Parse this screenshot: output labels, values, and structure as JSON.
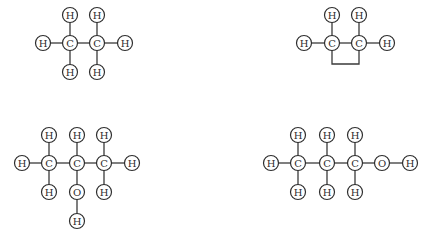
{
  "diagram": {
    "title": "",
    "atom_radius": 7.5,
    "colors": {
      "stroke": "#2e2e2e",
      "fill": "#ffffff",
      "background": "#ffffff"
    },
    "molecules": [
      {
        "name": "ethane",
        "atoms": [
          {
            "id": "c1",
            "label": "C",
            "x": 70,
            "y": 43
          },
          {
            "id": "c2",
            "label": "C",
            "x": 97,
            "y": 43
          },
          {
            "id": "h1",
            "label": "H",
            "x": 43,
            "y": 43
          },
          {
            "id": "h2",
            "label": "H",
            "x": 70,
            "y": 15
          },
          {
            "id": "h3",
            "label": "H",
            "x": 70,
            "y": 72
          },
          {
            "id": "h4",
            "label": "H",
            "x": 97,
            "y": 15
          },
          {
            "id": "h5",
            "label": "H",
            "x": 97,
            "y": 72
          },
          {
            "id": "h6",
            "label": "H",
            "x": 125,
            "y": 43
          }
        ],
        "bonds": [
          [
            "h1",
            "c1"
          ],
          [
            "c1",
            "c2"
          ],
          [
            "c2",
            "h6"
          ],
          [
            "h2",
            "c1"
          ],
          [
            "c1",
            "h3"
          ],
          [
            "h4",
            "c2"
          ],
          [
            "c2",
            "h5"
          ]
        ]
      },
      {
        "name": "cyclic-c2-structure",
        "atoms": [
          {
            "id": "c1",
            "label": "C",
            "x": 332,
            "y": 43
          },
          {
            "id": "c2",
            "label": "C",
            "x": 359,
            "y": 43
          },
          {
            "id": "h1",
            "label": "H",
            "x": 304,
            "y": 43
          },
          {
            "id": "h2",
            "label": "H",
            "x": 332,
            "y": 15
          },
          {
            "id": "h3",
            "label": "H",
            "x": 359,
            "y": 15
          },
          {
            "id": "h4",
            "label": "H",
            "x": 387,
            "y": 43
          }
        ],
        "bonds": [
          [
            "h1",
            "c1"
          ],
          [
            "c1",
            "c2"
          ],
          [
            "c2",
            "h4"
          ],
          [
            "h2",
            "c1"
          ],
          [
            "h3",
            "c2"
          ]
        ],
        "ring_path": "M332,50 L332,64 L359,64 L359,50"
      },
      {
        "name": "2-propanol",
        "atoms": [
          {
            "id": "c1",
            "label": "C",
            "x": 49,
            "y": 163
          },
          {
            "id": "c2",
            "label": "C",
            "x": 77,
            "y": 163
          },
          {
            "id": "c3",
            "label": "C",
            "x": 104,
            "y": 163
          },
          {
            "id": "h1",
            "label": "H",
            "x": 22,
            "y": 163
          },
          {
            "id": "h2",
            "label": "H",
            "x": 49,
            "y": 135
          },
          {
            "id": "h3",
            "label": "H",
            "x": 49,
            "y": 192
          },
          {
            "id": "h4",
            "label": "H",
            "x": 77,
            "y": 135
          },
          {
            "id": "o1",
            "label": "O",
            "x": 77,
            "y": 192
          },
          {
            "id": "h5",
            "label": "H",
            "x": 77,
            "y": 221
          },
          {
            "id": "h6",
            "label": "H",
            "x": 104,
            "y": 135
          },
          {
            "id": "h7",
            "label": "H",
            "x": 104,
            "y": 192
          },
          {
            "id": "h8",
            "label": "H",
            "x": 132,
            "y": 163
          }
        ],
        "bonds": [
          [
            "h1",
            "c1"
          ],
          [
            "c1",
            "c2"
          ],
          [
            "c2",
            "c3"
          ],
          [
            "c3",
            "h8"
          ],
          [
            "h2",
            "c1"
          ],
          [
            "c1",
            "h3"
          ],
          [
            "h4",
            "c2"
          ],
          [
            "c2",
            "o1"
          ],
          [
            "o1",
            "h5"
          ],
          [
            "h6",
            "c3"
          ],
          [
            "c3",
            "h7"
          ]
        ]
      },
      {
        "name": "1-propanol",
        "atoms": [
          {
            "id": "h1",
            "label": "H",
            "x": 271,
            "y": 163
          },
          {
            "id": "c1",
            "label": "C",
            "x": 298,
            "y": 163
          },
          {
            "id": "c2",
            "label": "C",
            "x": 327,
            "y": 163
          },
          {
            "id": "c3",
            "label": "C",
            "x": 355,
            "y": 163
          },
          {
            "id": "o1",
            "label": "O",
            "x": 382,
            "y": 163
          },
          {
            "id": "h8",
            "label": "H",
            "x": 410,
            "y": 163
          },
          {
            "id": "h2",
            "label": "H",
            "x": 298,
            "y": 135
          },
          {
            "id": "h3",
            "label": "H",
            "x": 298,
            "y": 192
          },
          {
            "id": "h4",
            "label": "H",
            "x": 327,
            "y": 135
          },
          {
            "id": "h5",
            "label": "H",
            "x": 327,
            "y": 192
          },
          {
            "id": "h6",
            "label": "H",
            "x": 355,
            "y": 135
          },
          {
            "id": "h7",
            "label": "H",
            "x": 355,
            "y": 192
          }
        ],
        "bonds": [
          [
            "h1",
            "c1"
          ],
          [
            "c1",
            "c2"
          ],
          [
            "c2",
            "c3"
          ],
          [
            "c3",
            "o1"
          ],
          [
            "o1",
            "h8"
          ],
          [
            "h2",
            "c1"
          ],
          [
            "c1",
            "h3"
          ],
          [
            "h4",
            "c2"
          ],
          [
            "c2",
            "h5"
          ],
          [
            "h6",
            "c3"
          ],
          [
            "c3",
            "h7"
          ]
        ]
      }
    ]
  }
}
